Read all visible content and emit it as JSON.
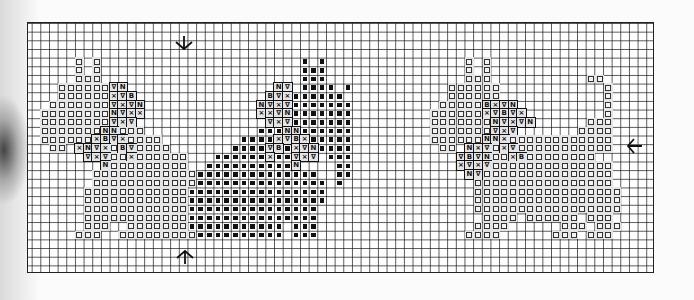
{
  "chart": {
    "type": "cross-stitch-pattern",
    "grid": {
      "columns": 73,
      "rows": 29,
      "cell_px": 8.67
    },
    "legend_symbols": {
      "o": {
        "name": "open-square",
        "glyph": ""
      },
      "#": {
        "name": "filled-square",
        "glyph": ""
      },
      "v": {
        "name": "nabla",
        "glyph": "∇"
      },
      "x": {
        "name": "cross",
        "glyph": "×"
      },
      "n": {
        "name": "n-symbol",
        "glyph": "N"
      },
      "b": {
        "name": "b-symbol",
        "glyph": "B"
      }
    },
    "center_markers": [
      {
        "name": "down-arrow-icon",
        "glyph": "↓",
        "x": 184,
        "y": 42,
        "direction": "down"
      },
      {
        "name": "up-arrow-icon",
        "glyph": "↑",
        "x": 184,
        "y": 257,
        "direction": "up"
      },
      {
        "name": "left-arrow-icon",
        "glyph": "←",
        "x": 634,
        "y": 146,
        "direction": "left"
      }
    ],
    "motifs": [
      {
        "name": "left-cat",
        "segments": [
          [
            4,
            6,
            6,
            "o"
          ],
          [
            4,
            8,
            8,
            "o"
          ],
          [
            5,
            6,
            6,
            "o"
          ],
          [
            5,
            8,
            8,
            "o"
          ],
          [
            6,
            6,
            8,
            "o"
          ],
          [
            7,
            4,
            9,
            "o"
          ],
          [
            7,
            10,
            10,
            "v"
          ],
          [
            7,
            11,
            11,
            "n"
          ],
          [
            8,
            4,
            9,
            "o"
          ],
          [
            8,
            10,
            10,
            "x"
          ],
          [
            8,
            11,
            11,
            "v"
          ],
          [
            8,
            12,
            12,
            "b"
          ],
          [
            9,
            3,
            9,
            "o"
          ],
          [
            9,
            10,
            10,
            "v"
          ],
          [
            9,
            11,
            11,
            "x"
          ],
          [
            9,
            12,
            12,
            "v"
          ],
          [
            9,
            13,
            13,
            "n"
          ],
          [
            10,
            2,
            9,
            "o"
          ],
          [
            10,
            10,
            10,
            "n"
          ],
          [
            10,
            11,
            11,
            "v"
          ],
          [
            10,
            12,
            12,
            "x"
          ],
          [
            10,
            13,
            13,
            "x"
          ],
          [
            11,
            2,
            9,
            "o"
          ],
          [
            11,
            10,
            10,
            "v"
          ],
          [
            11,
            11,
            11,
            "x"
          ],
          [
            11,
            12,
            12,
            "v"
          ],
          [
            12,
            2,
            8,
            "o"
          ],
          [
            12,
            9,
            9,
            "n"
          ],
          [
            12,
            10,
            10,
            "n"
          ],
          [
            12,
            11,
            13,
            "o"
          ],
          [
            13,
            2,
            7,
            "o"
          ],
          [
            13,
            8,
            8,
            "x"
          ],
          [
            13,
            9,
            9,
            "b"
          ],
          [
            13,
            10,
            10,
            "v"
          ],
          [
            13,
            11,
            11,
            "x"
          ],
          [
            13,
            12,
            15,
            "o"
          ],
          [
            14,
            3,
            4,
            "o"
          ],
          [
            14,
            6,
            6,
            "x"
          ],
          [
            14,
            7,
            7,
            "n"
          ],
          [
            14,
            8,
            8,
            "v"
          ],
          [
            14,
            9,
            9,
            "x"
          ],
          [
            14,
            10,
            10,
            "o"
          ],
          [
            14,
            11,
            11,
            "b"
          ],
          [
            14,
            12,
            12,
            "v"
          ],
          [
            14,
            13,
            16,
            "o"
          ],
          [
            15,
            7,
            7,
            "v"
          ],
          [
            15,
            8,
            8,
            "x"
          ],
          [
            15,
            9,
            9,
            "v"
          ],
          [
            15,
            10,
            11,
            "o"
          ],
          [
            15,
            12,
            12,
            "x"
          ],
          [
            15,
            13,
            18,
            "o"
          ],
          [
            16,
            9,
            9,
            "n"
          ],
          [
            16,
            10,
            18,
            "o"
          ],
          [
            17,
            8,
            19,
            "o"
          ],
          [
            18,
            8,
            19,
            "o"
          ],
          [
            19,
            7,
            18,
            "o"
          ],
          [
            20,
            7,
            18,
            "o"
          ],
          [
            21,
            7,
            18,
            "o"
          ],
          [
            22,
            7,
            18,
            "o"
          ],
          [
            23,
            7,
            9,
            "o"
          ],
          [
            23,
            12,
            18,
            "o"
          ],
          [
            24,
            6,
            8,
            "o"
          ],
          [
            24,
            11,
            19,
            "o"
          ]
        ]
      },
      {
        "name": "center-dog",
        "segments": [
          [
            4,
            32,
            32,
            "#"
          ],
          [
            4,
            34,
            34,
            "#"
          ],
          [
            5,
            32,
            34,
            "#"
          ],
          [
            6,
            32,
            34,
            "#"
          ],
          [
            7,
            29,
            29,
            "n"
          ],
          [
            7,
            30,
            30,
            "v"
          ],
          [
            7,
            32,
            35,
            "#"
          ],
          [
            7,
            37,
            37,
            "#"
          ],
          [
            8,
            28,
            28,
            "b"
          ],
          [
            8,
            29,
            29,
            "v"
          ],
          [
            8,
            30,
            30,
            "x"
          ],
          [
            8,
            31,
            36,
            "#"
          ],
          [
            9,
            27,
            27,
            "n"
          ],
          [
            9,
            28,
            28,
            "v"
          ],
          [
            9,
            29,
            29,
            "x"
          ],
          [
            9,
            30,
            30,
            "v"
          ],
          [
            9,
            31,
            37,
            "#"
          ],
          [
            10,
            27,
            27,
            "x"
          ],
          [
            10,
            28,
            28,
            "x"
          ],
          [
            10,
            29,
            29,
            "v"
          ],
          [
            10,
            30,
            30,
            "n"
          ],
          [
            10,
            31,
            37,
            "#"
          ],
          [
            11,
            28,
            28,
            "v"
          ],
          [
            11,
            29,
            29,
            "x"
          ],
          [
            11,
            30,
            30,
            "v"
          ],
          [
            11,
            31,
            37,
            "#"
          ],
          [
            12,
            27,
            29,
            "#"
          ],
          [
            12,
            30,
            30,
            "n"
          ],
          [
            12,
            31,
            31,
            "n"
          ],
          [
            12,
            32,
            37,
            "#"
          ],
          [
            13,
            25,
            28,
            "#"
          ],
          [
            13,
            29,
            29,
            "x"
          ],
          [
            13,
            30,
            30,
            "v"
          ],
          [
            13,
            31,
            31,
            "b"
          ],
          [
            13,
            32,
            32,
            "x"
          ],
          [
            13,
            33,
            37,
            "#"
          ],
          [
            14,
            24,
            27,
            "#"
          ],
          [
            14,
            28,
            28,
            "v"
          ],
          [
            14,
            29,
            29,
            "b"
          ],
          [
            14,
            30,
            30,
            "#"
          ],
          [
            14,
            31,
            31,
            "x"
          ],
          [
            14,
            32,
            32,
            "v"
          ],
          [
            14,
            33,
            33,
            "n"
          ],
          [
            14,
            34,
            37,
            "#"
          ],
          [
            15,
            22,
            27,
            "#"
          ],
          [
            15,
            28,
            28,
            "x"
          ],
          [
            15,
            29,
            30,
            "#"
          ],
          [
            15,
            31,
            31,
            "v"
          ],
          [
            15,
            32,
            32,
            "x"
          ],
          [
            15,
            33,
            33,
            "v"
          ],
          [
            15,
            35,
            37,
            "#"
          ],
          [
            16,
            21,
            30,
            "#"
          ],
          [
            16,
            31,
            31,
            "n"
          ],
          [
            16,
            36,
            37,
            "#"
          ],
          [
            17,
            20,
            33,
            "#"
          ],
          [
            17,
            36,
            37,
            "#"
          ],
          [
            18,
            20,
            34,
            "#"
          ],
          [
            18,
            36,
            36,
            "#"
          ],
          [
            19,
            19,
            34,
            "#"
          ],
          [
            20,
            19,
            34,
            "#"
          ],
          [
            21,
            19,
            33,
            "#"
          ],
          [
            22,
            19,
            33,
            "#"
          ],
          [
            23,
            19,
            29,
            "#"
          ],
          [
            23,
            31,
            33,
            "#"
          ],
          [
            24,
            20,
            29,
            "#"
          ],
          [
            24,
            31,
            33,
            "#"
          ]
        ]
      },
      {
        "name": "right-cat",
        "segments": [
          [
            4,
            51,
            51,
            "o"
          ],
          [
            4,
            53,
            53,
            "o"
          ],
          [
            5,
            51,
            51,
            "o"
          ],
          [
            5,
            53,
            53,
            "o"
          ],
          [
            6,
            51,
            53,
            "o"
          ],
          [
            6,
            65,
            66,
            "o"
          ],
          [
            7,
            49,
            54,
            "o"
          ],
          [
            7,
            67,
            67,
            "o"
          ],
          [
            8,
            49,
            54,
            "o"
          ],
          [
            8,
            67,
            67,
            "o"
          ],
          [
            9,
            48,
            52,
            "o"
          ],
          [
            9,
            53,
            53,
            "b"
          ],
          [
            9,
            54,
            54,
            "x"
          ],
          [
            9,
            55,
            55,
            "v"
          ],
          [
            9,
            56,
            56,
            "n"
          ],
          [
            9,
            67,
            67,
            "o"
          ],
          [
            10,
            47,
            52,
            "o"
          ],
          [
            10,
            53,
            53,
            "x"
          ],
          [
            10,
            54,
            54,
            "v"
          ],
          [
            10,
            55,
            55,
            "b"
          ],
          [
            10,
            56,
            56,
            "v"
          ],
          [
            10,
            57,
            57,
            "x"
          ],
          [
            10,
            67,
            67,
            "o"
          ],
          [
            11,
            47,
            53,
            "o"
          ],
          [
            11,
            54,
            54,
            "n"
          ],
          [
            11,
            55,
            55,
            "v"
          ],
          [
            11,
            56,
            56,
            "x"
          ],
          [
            11,
            57,
            57,
            "v"
          ],
          [
            11,
            58,
            58,
            "n"
          ],
          [
            11,
            65,
            67,
            "o"
          ],
          [
            12,
            47,
            53,
            "o"
          ],
          [
            12,
            54,
            54,
            "v"
          ],
          [
            12,
            55,
            55,
            "x"
          ],
          [
            12,
            56,
            56,
            "v"
          ],
          [
            12,
            64,
            67,
            "o"
          ],
          [
            13,
            47,
            52,
            "o"
          ],
          [
            13,
            53,
            53,
            "n"
          ],
          [
            13,
            54,
            54,
            "n"
          ],
          [
            13,
            55,
            55,
            "x"
          ],
          [
            13,
            56,
            67,
            "o"
          ],
          [
            14,
            48,
            49,
            "o"
          ],
          [
            14,
            51,
            51,
            "n"
          ],
          [
            14,
            52,
            52,
            "x"
          ],
          [
            14,
            53,
            53,
            "v"
          ],
          [
            14,
            54,
            54,
            "o"
          ],
          [
            14,
            55,
            55,
            "x"
          ],
          [
            14,
            56,
            56,
            "v"
          ],
          [
            14,
            57,
            67,
            "o"
          ],
          [
            15,
            50,
            50,
            "v"
          ],
          [
            15,
            51,
            51,
            "b"
          ],
          [
            15,
            52,
            52,
            "v"
          ],
          [
            15,
            53,
            53,
            "n"
          ],
          [
            15,
            54,
            55,
            "o"
          ],
          [
            15,
            56,
            56,
            "x"
          ],
          [
            15,
            57,
            57,
            "b"
          ],
          [
            15,
            58,
            65,
            "o"
          ],
          [
            16,
            50,
            50,
            "x"
          ],
          [
            16,
            51,
            51,
            "v"
          ],
          [
            16,
            52,
            52,
            "x"
          ],
          [
            16,
            53,
            53,
            "v"
          ],
          [
            16,
            54,
            67,
            "o"
          ],
          [
            17,
            51,
            51,
            "n"
          ],
          [
            17,
            52,
            52,
            "v"
          ],
          [
            17,
            53,
            67,
            "o"
          ],
          [
            18,
            52,
            67,
            "o"
          ],
          [
            19,
            52,
            68,
            "o"
          ],
          [
            20,
            52,
            68,
            "o"
          ],
          [
            21,
            52,
            68,
            "o"
          ],
          [
            22,
            53,
            56,
            "o"
          ],
          [
            22,
            58,
            63,
            "o"
          ],
          [
            22,
            65,
            67,
            "o"
          ],
          [
            23,
            52,
            55,
            "o"
          ],
          [
            23,
            62,
            64,
            "o"
          ],
          [
            23,
            66,
            68,
            "o"
          ],
          [
            24,
            51,
            54,
            "o"
          ],
          [
            24,
            61,
            63,
            "o"
          ],
          [
            24,
            65,
            67,
            "o"
          ]
        ]
      }
    ]
  }
}
